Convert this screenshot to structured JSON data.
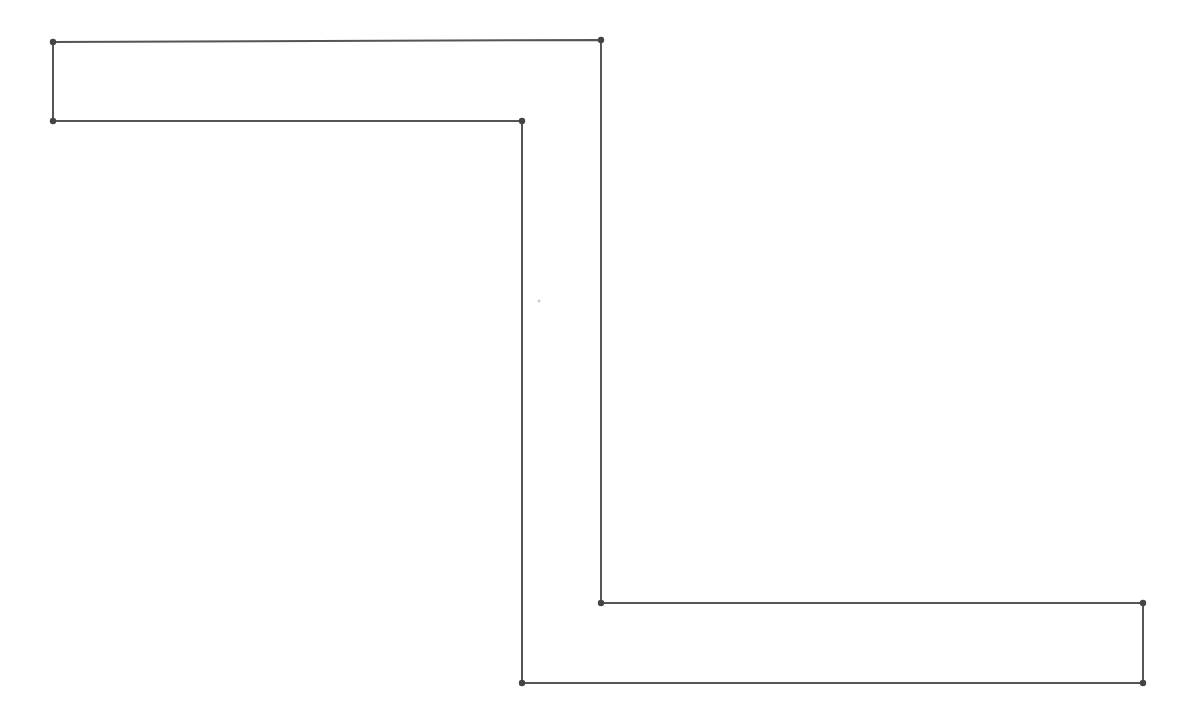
{
  "diagram": {
    "type": "polygon",
    "shape": "Z-shaped (step) polygon",
    "stroke_color": "#555555",
    "vertex_color": "#444444",
    "background": "#ffffff",
    "vertices": [
      {
        "x": 53,
        "y": 42
      },
      {
        "x": 601,
        "y": 40
      },
      {
        "x": 601,
        "y": 603
      },
      {
        "x": 1143,
        "y": 603
      },
      {
        "x": 1143,
        "y": 683
      },
      {
        "x": 522,
        "y": 683
      },
      {
        "x": 522,
        "y": 121
      },
      {
        "x": 53,
        "y": 121
      }
    ],
    "stray_mark": {
      "x": 539,
      "y": 301
    }
  }
}
